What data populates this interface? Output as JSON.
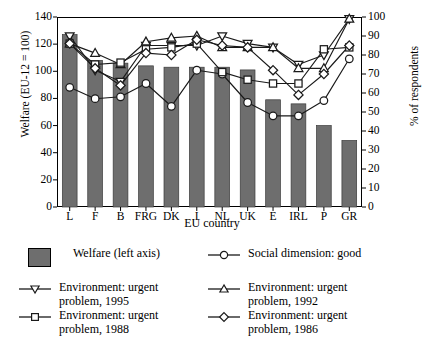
{
  "axes": {
    "left_title": "Welfare (EU-12 = 100)",
    "right_title": "% of respondents",
    "x_title": "EU country",
    "left_ticks": [
      "0",
      "20",
      "40",
      "60",
      "80",
      "100",
      "120",
      "140"
    ],
    "right_ticks": [
      "0",
      "10",
      "20",
      "30",
      "40",
      "50",
      "60",
      "70",
      "80",
      "90",
      "100"
    ],
    "x_ticks": [
      "L",
      "F",
      "B",
      "FRG",
      "DK",
      "I",
      "NL",
      "UK",
      "E",
      "IRL",
      "P",
      "GR"
    ]
  },
  "legend": {
    "welfare": "Welfare (left axis)",
    "social": "Social dimension: good",
    "env1995": "Environment: urgent\nproblem, 1995",
    "env1992": "Environment: urgent\nproblem, 1992",
    "env1988": "Environment: urgent\nproblem, 1988",
    "env1986": "Environment: urgent\nproblem, 1986"
  },
  "colors": {
    "bar_fill": "#6e6e6e",
    "line": "#1a1a1a",
    "marker_fill": "#ffffff",
    "social_marker_fill": "#ffffff",
    "frame": "#000000"
  },
  "chart_data": {
    "type": "bar",
    "title": "",
    "xlabel": "EU country",
    "ylabel": "Welfare (EU-12 = 100)",
    "y2label": "% of respondents",
    "ylim": [
      0,
      140
    ],
    "y2lim": [
      0,
      100
    ],
    "grid": false,
    "legend_position": "below",
    "categories": [
      "L",
      "F",
      "B",
      "FRG",
      "DK",
      "I",
      "NL",
      "UK",
      "E",
      "IRL",
      "P",
      "GR"
    ],
    "values": [
      127,
      108,
      106,
      104,
      103,
      103,
      103,
      101,
      79,
      76,
      60,
      49
    ],
    "series": [
      {
        "name": "Welfare (left axis)",
        "type": "bar",
        "axis": "left",
        "values": [
          127,
          108,
          106,
          104,
          103,
          103,
          103,
          101,
          79,
          76,
          60,
          49
        ]
      },
      {
        "name": "Social dimension: good",
        "type": "line",
        "marker": "circle",
        "axis": "right",
        "values": [
          63,
          57,
          58,
          65,
          53,
          72,
          70,
          55,
          48,
          48,
          56,
          78
        ]
      },
      {
        "name": "Environment: urgent problem, 1995",
        "type": "line",
        "marker": "triangle-down",
        "axis": "right",
        "values": [
          90,
          72,
          66,
          85,
          85,
          85,
          90,
          86,
          84,
          75,
          80,
          99
        ]
      },
      {
        "name": "Environment: urgent problem, 1992",
        "type": "line",
        "marker": "triangle-up",
        "axis": "right",
        "values": [
          86,
          81,
          75,
          87,
          89,
          90,
          84,
          84,
          84,
          73,
          73,
          99
        ]
      },
      {
        "name": "Environment: urgent problem, 1988",
        "type": "line",
        "marker": "square",
        "axis": "right",
        "values": [
          86,
          75,
          76,
          83,
          84,
          86,
          71,
          67,
          65,
          65,
          83,
          84
        ]
      },
      {
        "name": "Environment: urgent problem, 1986",
        "type": "line",
        "marker": "diamond",
        "axis": "right",
        "values": [
          86,
          73,
          64,
          81,
          80,
          88,
          85,
          84,
          72,
          59,
          70,
          85
        ]
      }
    ]
  }
}
